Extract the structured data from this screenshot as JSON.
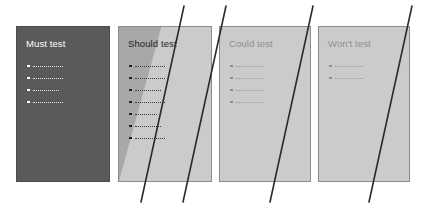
{
  "diagram": {
    "type": "moscow-prioritisation-quadrants",
    "background_color": "#ffffff",
    "strike_line_color": "#2b2b2b",
    "panels": [
      {
        "id": "must",
        "title": "Must test",
        "fill_color": "#5a5a5a",
        "title_color": "#ffffff",
        "bullet_count": 4,
        "bullets": [
          "",
          "",
          "",
          ""
        ],
        "bullet_line_widths": [
          30,
          30,
          26,
          30
        ],
        "shaded_wedge": false,
        "struck_through": false
      },
      {
        "id": "should",
        "title": "Should test",
        "fill_color": "#cbcbcb",
        "wedge_color": "#a8a8a8",
        "title_color": "#1f1f1f",
        "bullet_count": 7,
        "bullets": [
          "",
          "",
          "",
          "",
          "",
          "",
          ""
        ],
        "bullet_line_widths": [
          30,
          30,
          26,
          30,
          22,
          26,
          30
        ],
        "shaded_wedge": true,
        "struck_through": true
      },
      {
        "id": "could",
        "title": "Could test",
        "fill_color": "#cbcbcb",
        "title_color": "#8f8f8f",
        "bullet_count": 4,
        "bullets": [
          "",
          "",
          "",
          ""
        ],
        "bullet_line_widths": [
          28,
          28,
          28,
          28
        ],
        "shaded_wedge": false,
        "struck_through": true
      },
      {
        "id": "wont",
        "title": "Won't test",
        "fill_color": "#cbcbcb",
        "title_color": "#8f8f8f",
        "bullet_count": 2,
        "bullets": [
          "",
          ""
        ],
        "bullet_line_widths": [
          28,
          28
        ],
        "shaded_wedge": false,
        "struck_through": true
      }
    ],
    "strike_lines": [
      {
        "id": "strike-1",
        "x1": 184,
        "y1": 6,
        "x2": 141,
        "y2": 202
      },
      {
        "id": "strike-2",
        "x1": 226,
        "y1": 6,
        "x2": 183,
        "y2": 202
      },
      {
        "id": "strike-3",
        "x1": 313,
        "y1": 6,
        "x2": 270,
        "y2": 202
      },
      {
        "id": "strike-4",
        "x1": 412,
        "y1": 6,
        "x2": 369,
        "y2": 202
      }
    ]
  }
}
